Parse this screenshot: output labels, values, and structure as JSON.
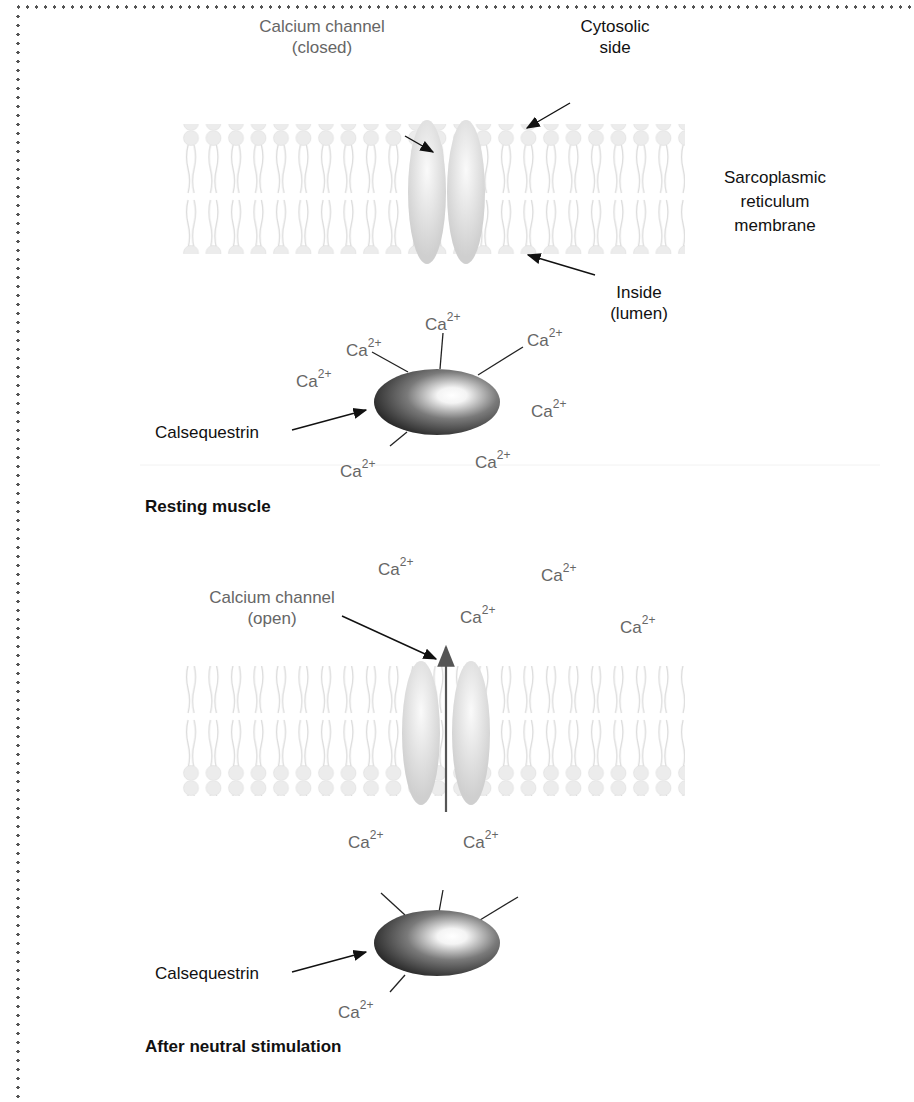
{
  "panels": {
    "resting": {
      "title": "Resting muscle",
      "channel_label_line1": "Calcium channel",
      "channel_label_line2": "(closed)",
      "cytosolic_line1": "Cytosolic",
      "cytosolic_line2": "side",
      "membrane_line1": "Sarcoplasmic",
      "membrane_line2": "reticulum",
      "membrane_line3": "membrane",
      "inside_line1": "Inside",
      "inside_line2": "(lumen)",
      "protein_label": "Calsequestrin",
      "ion_base": "Ca",
      "ion_charge": "2+"
    },
    "stimulated": {
      "title": "After neutral stimulation",
      "channel_label_line1": "Calcium channel",
      "channel_label_line2": "(open)",
      "protein_label": "Calsequestrin",
      "ion_base": "Ca",
      "ion_charge": "2+"
    }
  },
  "colors": {
    "frame_dots": "#555555",
    "label_gray": "#666666",
    "label_dark": "#111111",
    "membrane": "#e6e6e6",
    "protein_dark": "#2a2a2a"
  }
}
